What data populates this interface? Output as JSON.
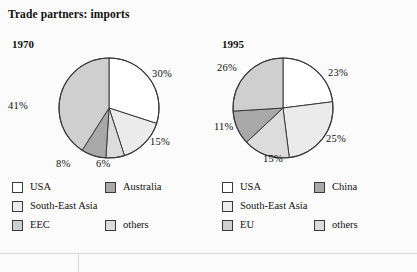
{
  "figure": {
    "title": "Trade partners: imports",
    "background": "#fbfbfb",
    "rule_color": "#d8d8d8"
  },
  "colors": {
    "white": "#ffffff",
    "very_light_gray": "#ebebeb",
    "light_gray": "#dcdcdc",
    "medium_gray": "#cfcfcf",
    "dark_gray": "#a8a8a8",
    "outline": "#3a3a3a"
  },
  "panels": [
    {
      "year": "1970",
      "legend": [
        {
          "label": "USA",
          "color": "#ffffff"
        },
        {
          "label": "Australia",
          "color": "#a8a8a8"
        },
        {
          "label": "South-East Asia",
          "color": "#ebebeb"
        },
        {
          "label": "EEC",
          "color": "#cfcfcf"
        },
        {
          "label": "others",
          "color": "#dcdcdc"
        }
      ],
      "labels": [
        {
          "text": "30%",
          "left": "152px",
          "top": "68px"
        },
        {
          "text": "15%",
          "left": "150px",
          "top": "136px"
        },
        {
          "text": "6%",
          "left": "96px",
          "top": "158px"
        },
        {
          "text": "8%",
          "left": "56px",
          "top": "158px"
        },
        {
          "text": "41%",
          "left": "8px",
          "top": "100px"
        }
      ]
    },
    {
      "year": "1995",
      "legend": [
        {
          "label": "USA",
          "color": "#ffffff"
        },
        {
          "label": "China",
          "color": "#a8a8a8"
        },
        {
          "label": "South-East Asia",
          "color": "#ebebeb"
        },
        {
          "label": "EU",
          "color": "#cfcfcf"
        },
        {
          "label": "others",
          "color": "#dcdcdc"
        }
      ],
      "labels": [
        {
          "text": "23%",
          "left": "119px",
          "top": "67px"
        },
        {
          "text": "25%",
          "left": "117px",
          "top": "133px"
        },
        {
          "text": "15%",
          "left": "54px",
          "top": "153px"
        },
        {
          "text": "11%",
          "left": "5px",
          "top": "121px"
        },
        {
          "text": "26%",
          "left": "8px",
          "top": "62px"
        }
      ]
    }
  ],
  "chart_data": [
    {
      "type": "pie",
      "title": "1970",
      "categories": [
        "USA",
        "South-East Asia",
        "Australia",
        "EEC",
        "others"
      ],
      "values": [
        30,
        15,
        6,
        8,
        41
      ],
      "value_labels": [
        "30%",
        "15%",
        "6%",
        "8%",
        "41%"
      ],
      "colors": [
        "#ffffff",
        "#ebebeb",
        "#dcdcdc",
        "#a8a8a8",
        "#cfcfcf"
      ],
      "units": "percent",
      "start_angle_deg": 0,
      "direction": "clockwise",
      "legend_position": "below"
    },
    {
      "type": "pie",
      "title": "1995",
      "categories": [
        "USA",
        "South-East Asia",
        "others",
        "China",
        "EU"
      ],
      "values": [
        23,
        25,
        15,
        11,
        26
      ],
      "value_labels": [
        "23%",
        "25%",
        "15%",
        "11%",
        "26%"
      ],
      "colors": [
        "#ffffff",
        "#ebebeb",
        "#dcdcdc",
        "#a8a8a8",
        "#cfcfcf"
      ],
      "units": "percent",
      "start_angle_deg": 0,
      "direction": "clockwise",
      "legend_position": "below"
    }
  ]
}
